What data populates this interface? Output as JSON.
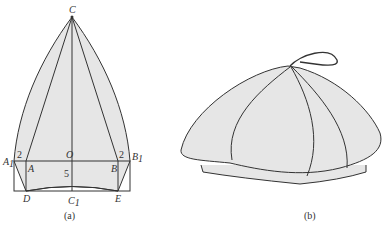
{
  "figure_a": {
    "caption": "(a)",
    "points": {
      "C": "C",
      "O": "O",
      "A1": "A",
      "A1_sub": "1",
      "B1": "B",
      "B1_sub": "1",
      "A": "A",
      "B": "B",
      "D": "D",
      "E": "E",
      "C1": "C",
      "C1_sub": "1"
    },
    "dimensions": {
      "left_offset": "2",
      "right_offset": "2",
      "height": "5"
    }
  },
  "figure_b": {
    "caption": "(b)"
  },
  "colors": {
    "fill": "#e6e6e6",
    "stroke": "#333333"
  }
}
